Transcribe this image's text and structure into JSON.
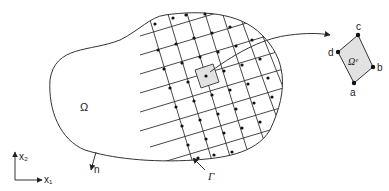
{
  "diagram": {
    "type": "finite-element-domain-discretization",
    "labels": {
      "domain": "Ω",
      "boundary": "Γ",
      "normal": "n",
      "element": "Ωᵉ",
      "axis_x": "x₁",
      "axis_y": "x₂",
      "node_a": "a",
      "node_b": "b",
      "node_c": "c",
      "node_d": "d"
    },
    "colors": {
      "line": "#333333",
      "node": "#111111",
      "element_fill": "#e2e2e2",
      "background": "#ffffff"
    }
  }
}
